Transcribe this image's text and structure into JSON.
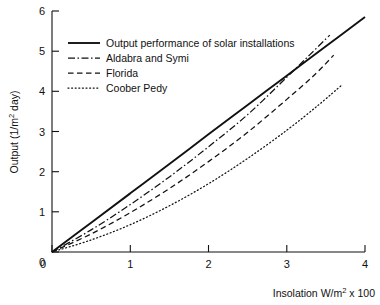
{
  "chart_data": {
    "type": "line",
    "title": "",
    "xlabel": "Insolation W/m² x 100",
    "ylabel": "Output (1/m² day)",
    "xlim": [
      0,
      4
    ],
    "ylim": [
      0,
      6
    ],
    "xticks": [
      "0",
      "1",
      "2",
      "3",
      "4"
    ],
    "yticks": [
      "0",
      "1",
      "2",
      "3",
      "4",
      "5",
      "6"
    ],
    "grid": false,
    "legend_position": "upper-left-inside",
    "series": [
      {
        "name": "Output performance of solar installations",
        "style": "solid",
        "color": "#111111",
        "x": [
          0,
          0.5,
          1.0,
          1.5,
          2.0,
          2.5,
          3.0,
          3.5,
          4.0
        ],
        "y": [
          0,
          0.73,
          1.46,
          2.19,
          2.93,
          3.66,
          4.39,
          5.12,
          5.85
        ]
      },
      {
        "name": "Aldabra and Symi",
        "style": "dash-dot",
        "color": "#111111",
        "x": [
          0,
          0.5,
          1.0,
          1.5,
          2.0,
          2.5,
          3.0,
          3.3,
          3.55
        ],
        "y": [
          0,
          0.55,
          1.18,
          1.87,
          2.62,
          3.42,
          4.35,
          4.92,
          5.4
        ]
      },
      {
        "name": "Florida",
        "style": "dashed",
        "color": "#111111",
        "x": [
          0,
          0.5,
          1.0,
          1.5,
          2.0,
          2.5,
          3.0,
          3.35,
          3.6
        ],
        "y": [
          0,
          0.45,
          0.98,
          1.58,
          2.25,
          2.98,
          3.8,
          4.4,
          4.9
        ]
      },
      {
        "name": "Coober Pedy",
        "style": "dotted",
        "color": "#111111",
        "x": [
          0,
          0.5,
          1.0,
          1.5,
          2.0,
          2.5,
          3.0,
          3.4,
          3.7
        ],
        "y": [
          0,
          0.3,
          0.68,
          1.15,
          1.7,
          2.33,
          3.03,
          3.65,
          4.15
        ]
      }
    ]
  },
  "axes": {
    "ylabel_main": "Output (1/m",
    "ylabel_sup": "2",
    "ylabel_tail": " day)",
    "xlabel_main": "Insolation W/m",
    "xlabel_sup": "2",
    "xlabel_tail": " x 100"
  },
  "legend": {
    "entries": [
      {
        "label": "Output performance of solar installations",
        "style": "solid"
      },
      {
        "label": "Aldabra and Symi",
        "style": "dash-dot"
      },
      {
        "label": "Florida",
        "style": "dashed"
      },
      {
        "label": "Coober Pedy",
        "style": "dotted"
      }
    ]
  }
}
